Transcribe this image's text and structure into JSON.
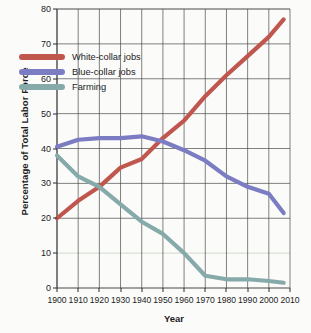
{
  "chart_data": {
    "type": "line",
    "title": "",
    "xlabel": "Year",
    "ylabel": "Percentage of Total Labor Force",
    "xlim": [
      1900,
      2010
    ],
    "ylim": [
      0,
      80
    ],
    "grid": true,
    "legend_position": "upper-left-inside",
    "xticks": [
      1900,
      1910,
      1920,
      1930,
      1940,
      1950,
      1960,
      1970,
      1980,
      1990,
      2000,
      2010
    ],
    "yticks": [
      0,
      10,
      20,
      30,
      40,
      50,
      60,
      70,
      80
    ],
    "x": [
      1900,
      1910,
      1920,
      1930,
      1940,
      1950,
      1960,
      1970,
      1980,
      1990,
      2000,
      2007
    ],
    "series": [
      {
        "name": "White-collar jobs",
        "color": "#c0574e",
        "values": [
          20,
          25,
          29,
          34.5,
          37,
          43,
          48,
          55,
          61,
          66.5,
          72,
          77
        ]
      },
      {
        "name": "Blue-collar jobs",
        "color": "#7b7cc2",
        "values": [
          40.5,
          42.5,
          43,
          43,
          43.5,
          42,
          39.5,
          36.5,
          32,
          29,
          27,
          21.5
        ]
      },
      {
        "name": "Farming",
        "color": "#86aaa9",
        "values": [
          38,
          32,
          29,
          24,
          19,
          15.5,
          10,
          3.5,
          2.5,
          2.5,
          2,
          1.5
        ]
      }
    ]
  }
}
